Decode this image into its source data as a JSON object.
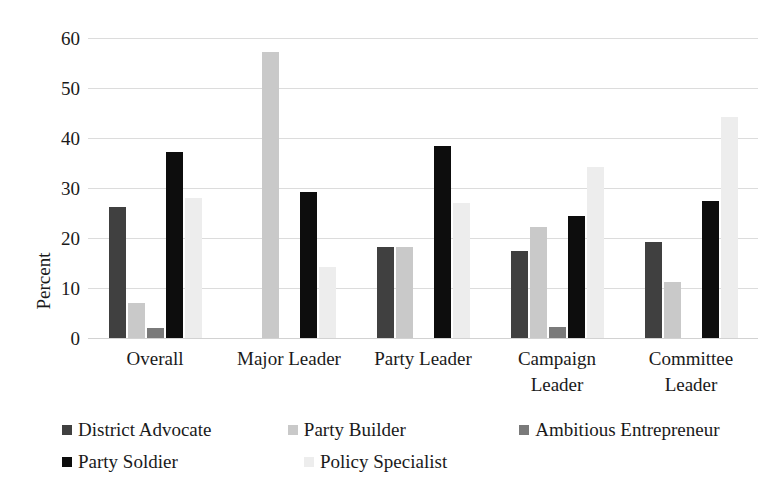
{
  "chart_data": {
    "type": "bar",
    "title": "",
    "xlabel": "",
    "ylabel": "Percent",
    "ylim": [
      0,
      60
    ],
    "yticks": [
      0,
      10,
      20,
      30,
      40,
      50,
      60
    ],
    "grid": true,
    "legend_position": "bottom-left",
    "categories": [
      "Overall",
      "Major Leader",
      "Party Leader",
      "Campaign Leader",
      "Committee Leader"
    ],
    "series": [
      {
        "name": "District Advocate",
        "color": "#404040",
        "values": [
          26.2,
          null,
          18.3,
          17.4,
          19.3
        ]
      },
      {
        "name": "Party Builder",
        "color": "#c9c9c9",
        "values": [
          7.0,
          57.2,
          18.3,
          22.3,
          11.3
        ]
      },
      {
        "name": "Ambitious Entrepreneur",
        "color": "#7a7a7a",
        "values": [
          2.0,
          null,
          null,
          2.2,
          null
        ]
      },
      {
        "name": "Party Soldier",
        "color": "#0d0d0d",
        "values": [
          37.2,
          29.2,
          38.5,
          24.4,
          27.5
        ]
      },
      {
        "name": "Policy Specialist",
        "color": "#ededed",
        "values": [
          28.0,
          14.3,
          27.0,
          34.3,
          44.3
        ]
      }
    ]
  },
  "axis": {
    "y_title": "Percent",
    "y_tick_labels": [
      "60",
      "50",
      "40",
      "30",
      "20",
      "10",
      "0"
    ]
  },
  "category_labels": [
    "Overall",
    "Major Leader",
    "Party Leader",
    "Campaign\nLeader",
    "Committee\nLeader"
  ],
  "legend": {
    "rows": [
      [
        {
          "label": "District Advocate",
          "swatch": "s0"
        },
        {
          "label": "Party Builder",
          "swatch": "s1"
        },
        {
          "label": "Ambitious Entrepreneur",
          "swatch": "s2"
        }
      ],
      [
        {
          "label": "Party Soldier",
          "swatch": "s3"
        },
        {
          "label": "Policy Specialist",
          "swatch": "s4"
        }
      ]
    ]
  },
  "colors": {
    "district_advocate": "#404040",
    "party_builder": "#c9c9c9",
    "ambitious_entrepreneur": "#7a7a7a",
    "party_soldier": "#0d0d0d",
    "policy_specialist": "#ededed",
    "gridline": "#dcdcdc",
    "text": "#1a1a1a",
    "background": "#ffffff"
  }
}
